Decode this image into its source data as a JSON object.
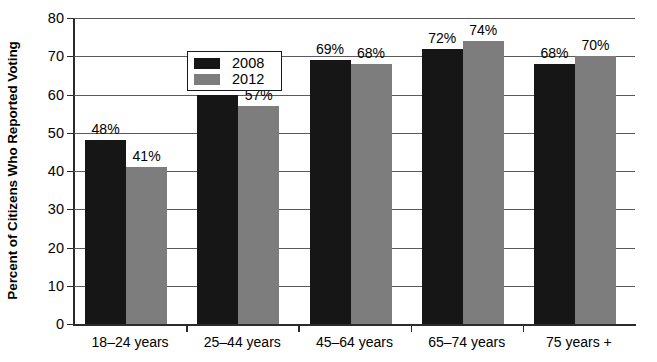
{
  "chart_data": {
    "type": "bar",
    "title": "",
    "xlabel": "",
    "ylabel": "Percent of Citizens Who Reported Voting",
    "categories": [
      "18–24 years",
      "25–44 years",
      "45–64 years",
      "65–74 years",
      "75 years +"
    ],
    "series": [
      {
        "name": "2008",
        "color": "#161616",
        "values": [
          48,
          60,
          69,
          72,
          68
        ],
        "labels": [
          "48%",
          "60%",
          "69%",
          "72%",
          "68%"
        ]
      },
      {
        "name": "2012",
        "color": "#7d7d7d",
        "values": [
          41,
          57,
          68,
          74,
          70
        ],
        "labels": [
          "41%",
          "57%",
          "68%",
          "74%",
          "70%"
        ]
      }
    ],
    "ylim": [
      0,
      80
    ],
    "ytick_values": [
      0,
      10,
      20,
      30,
      40,
      50,
      60,
      70,
      80
    ],
    "ytick_labels": [
      "0",
      "10",
      "20",
      "30",
      "40",
      "50",
      "60",
      "70",
      "80"
    ],
    "grid": "horizontal",
    "legend_position": "upper-left-inside",
    "value_labels_shown": true
  }
}
